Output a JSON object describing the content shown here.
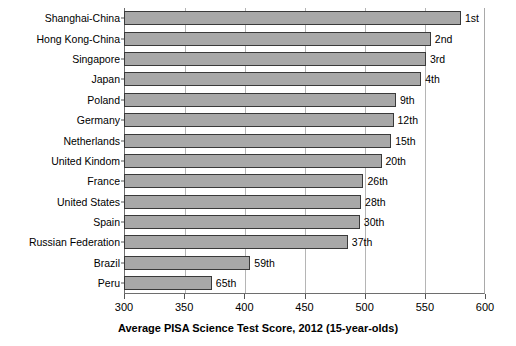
{
  "chart_data": {
    "type": "bar",
    "orientation": "horizontal",
    "title": "",
    "xlabel": "Average PISA Science Test Score, 2012 (15-year-olds)",
    "ylabel": "",
    "xlim": [
      300,
      600
    ],
    "xticks": [
      300,
      350,
      400,
      450,
      500,
      550,
      600
    ],
    "grid": true,
    "legend": "none",
    "categories": [
      "Shanghai-China",
      "Hong Kong-China",
      "Singapore",
      "Japan",
      "Poland",
      "Germany",
      "Netherlands",
      "United Kindom",
      "France",
      "United States",
      "Spain",
      "Russian Federation",
      "Brazil",
      "Peru"
    ],
    "values": [
      580,
      555,
      551,
      547,
      526,
      524,
      522,
      514,
      499,
      497,
      496,
      486,
      405,
      373
    ],
    "annotations": [
      "1st",
      "2nd",
      "3rd",
      "4th",
      "9th",
      "12th",
      "15th",
      "20th",
      "26th",
      "28th",
      "30th",
      "37th",
      "59th",
      "65th"
    ],
    "bar_color": "#a8a8a8",
    "bar_edge_color": "#3a3a3a",
    "background_color": "#ffffff"
  }
}
